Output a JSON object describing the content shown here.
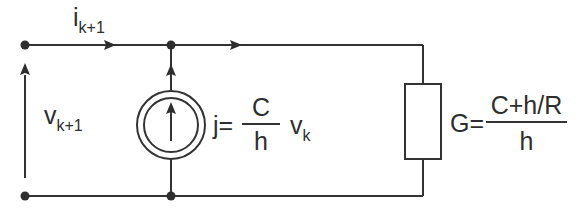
{
  "diagram": {
    "type": "circuit",
    "colors": {
      "wire": "#333333",
      "text": "#2e2e2e",
      "background": "#ffffff"
    },
    "current_label": {
      "symbol": "i",
      "subscript": "k+1"
    },
    "voltage_label": {
      "symbol": "v",
      "subscript": "k+1"
    },
    "source": {
      "name": "current-source",
      "equation_lhs": "j=",
      "numerator": "C",
      "denominator": "h",
      "factor_symbol": "v",
      "factor_subscript": "k"
    },
    "conductance": {
      "name": "resistor",
      "equation_lhs": "G=",
      "numerator": "C+h/R",
      "denominator": "h"
    },
    "nodes": [
      {
        "id": "top-left",
        "x": 25,
        "y": 45
      },
      {
        "id": "top-mid",
        "x": 171,
        "y": 45
      },
      {
        "id": "bottom-left",
        "x": 25,
        "y": 195
      },
      {
        "id": "bottom-mid",
        "x": 171,
        "y": 195
      }
    ]
  }
}
